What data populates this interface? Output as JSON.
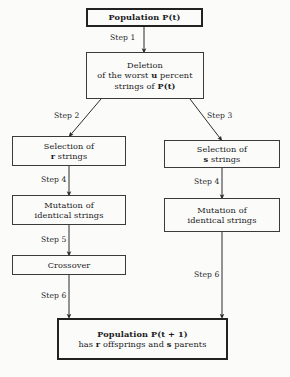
{
  "diagram": {
    "background": "#fbfbfa",
    "stroke": "#3a3a3a",
    "emphasis_stroke": "#222222"
  },
  "nodes": {
    "population_t": {
      "line1": "Population P(t)"
    },
    "deletion": {
      "line1": "Deletion",
      "line2": "of the worst u percent",
      "line3": "strings of P(t)"
    },
    "selection_r": {
      "line1": "Selection of",
      "line2": "r strings"
    },
    "selection_s": {
      "line1": "Selection of",
      "line2": "s strings"
    },
    "mutation_left": {
      "line1": "Mutation of",
      "line2": "identical strings"
    },
    "mutation_right": {
      "line1": "Mutation of",
      "line2": "identical strings"
    },
    "crossover": {
      "line1": "Crossover"
    },
    "population_t1": {
      "line1": "Population P(t + 1)",
      "line2": "has r offsprings and s parents"
    }
  },
  "steps": {
    "step1": "Step 1",
    "step2": "Step 2",
    "step3": "Step 3",
    "step4_left": "Step 4",
    "step4_right": "Step 4",
    "step5": "Step 5",
    "step6_left": "Step 6",
    "step6_right": "Step 6"
  }
}
